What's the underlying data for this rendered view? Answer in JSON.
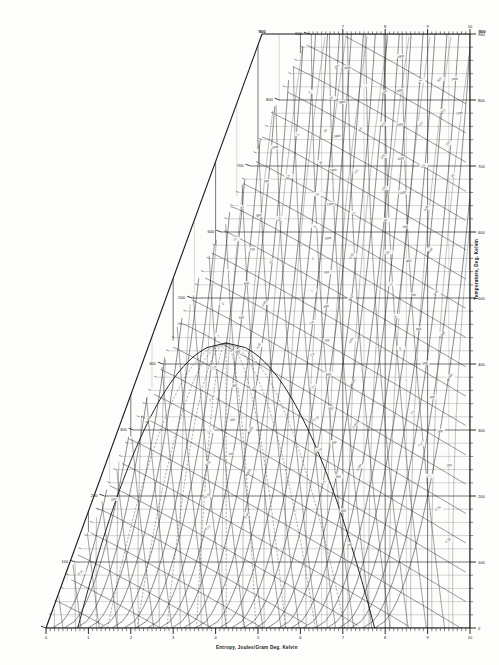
{
  "figure": {
    "kind": "thermodynamic-chart",
    "background_color": "#fdfdfc",
    "ink_color": "#1a1a1a"
  },
  "axes": {
    "x_title": "Entropy, Joules/Gram Deg. Kelvin",
    "y_title_right": "Temperature, Deg. Kelvin",
    "corner_label_top_left": "900",
    "corner_label_top_right": "900"
  },
  "chart_data": {
    "type": "line",
    "title": "",
    "subtitle": "",
    "xlabel": "Entropy, Joules/Gram Deg. Kelvin",
    "ylabel": "Temperature, Deg. Kelvin",
    "xlim": [
      0,
      10
    ],
    "ylim": [
      0,
      900
    ],
    "grid": true,
    "legend_position": "none",
    "x_ticks": [
      0,
      1,
      2,
      3,
      4,
      5,
      6,
      7,
      8,
      9,
      10
    ],
    "x_ticklabels": [
      "0",
      "1",
      "2",
      "3",
      "4",
      "5",
      "6",
      "7",
      "8",
      "9",
      "10"
    ],
    "x_minor_tick_step": 0.1,
    "y_ticks": [
      0,
      100,
      200,
      300,
      400,
      500,
      600,
      700,
      800,
      900
    ],
    "y_ticklabels": [
      "0",
      "100",
      "200",
      "300",
      "400",
      "500",
      "600",
      "700",
      "800",
      "900"
    ],
    "y_minor_tick_step": 20,
    "top_axis_ticks": [
      7,
      8,
      9,
      10
    ],
    "top_axis_ticklabels": [
      "7",
      "8",
      "9",
      "10"
    ],
    "plot_region": "wedge; left boundary is a diagonal running from (x=0,T=0) at bottom-left up to (x=6.2,T=900) at top-left; right boundary vertical at x=10",
    "series": [
      {
        "name": "isobar-family",
        "kind": "pressure-lines",
        "description": "steeply rising curves of constant pressure crossing the field left-to-right",
        "label_values": [
          "0.01",
          "0.02",
          "0.05",
          "0.1",
          "0.2",
          "0.5",
          "1",
          "2",
          "5",
          "10",
          "20",
          "50",
          "100",
          "200",
          "500",
          "1000"
        ],
        "count": 16
      },
      {
        "name": "isenthalp-family",
        "kind": "enthalpy-lines",
        "description": "shallow curves of constant enthalpy sweeping down to the right",
        "label_values": [
          "100",
          "200",
          "300",
          "400",
          "500",
          "600",
          "700",
          "800",
          "900",
          "1000",
          "1200",
          "1400",
          "1600",
          "1800",
          "2000"
        ],
        "count": 15
      },
      {
        "name": "isochore-family",
        "kind": "density-lines",
        "description": "constant density / specific volume lines rising steeply",
        "label_values": [
          "0.001",
          "0.002",
          "0.005",
          "0.01",
          "0.02",
          "0.05",
          "0.1",
          "0.2",
          "0.5",
          "1",
          "2",
          "5"
        ],
        "count": 12
      },
      {
        "name": "quality-lines",
        "kind": "dashed-quality",
        "description": "dashed lines of constant vapour quality inside the two-phase dome",
        "label_values": [
          "0.1",
          "0.2",
          "0.3",
          "0.4",
          "0.5",
          "0.6",
          "0.7",
          "0.8",
          "0.9"
        ],
        "count": 9
      },
      {
        "name": "saturation-dome",
        "kind": "two-phase-dome",
        "description": "closed saturation boundary with critical point near x=4.2, T=430"
      }
    ],
    "annotations": [
      {
        "text": "900",
        "x_px": 262,
        "y_px": 33
      },
      {
        "text": "900",
        "x_px": 482,
        "y_px": 33
      }
    ]
  }
}
